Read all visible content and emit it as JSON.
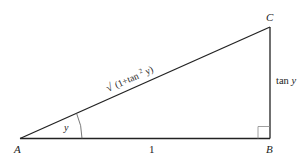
{
  "diagram": {
    "type": "right-triangle",
    "vertices": {
      "A": {
        "label": "A"
      },
      "B": {
        "label": "B"
      },
      "C": {
        "label": "C"
      }
    },
    "sides": {
      "AB": {
        "label": "1"
      },
      "BC": {
        "label_prefix": "tan",
        "label_var": "y"
      },
      "AC": {
        "label_root": "√",
        "label_open": "(1+tan",
        "label_sup": "2",
        "label_close": "y)"
      }
    },
    "angle_A": {
      "label": "y"
    },
    "right_angle_at": "B",
    "colors": {
      "stroke": "#222222",
      "light_stroke": "#888888",
      "background": "#ffffff"
    }
  }
}
